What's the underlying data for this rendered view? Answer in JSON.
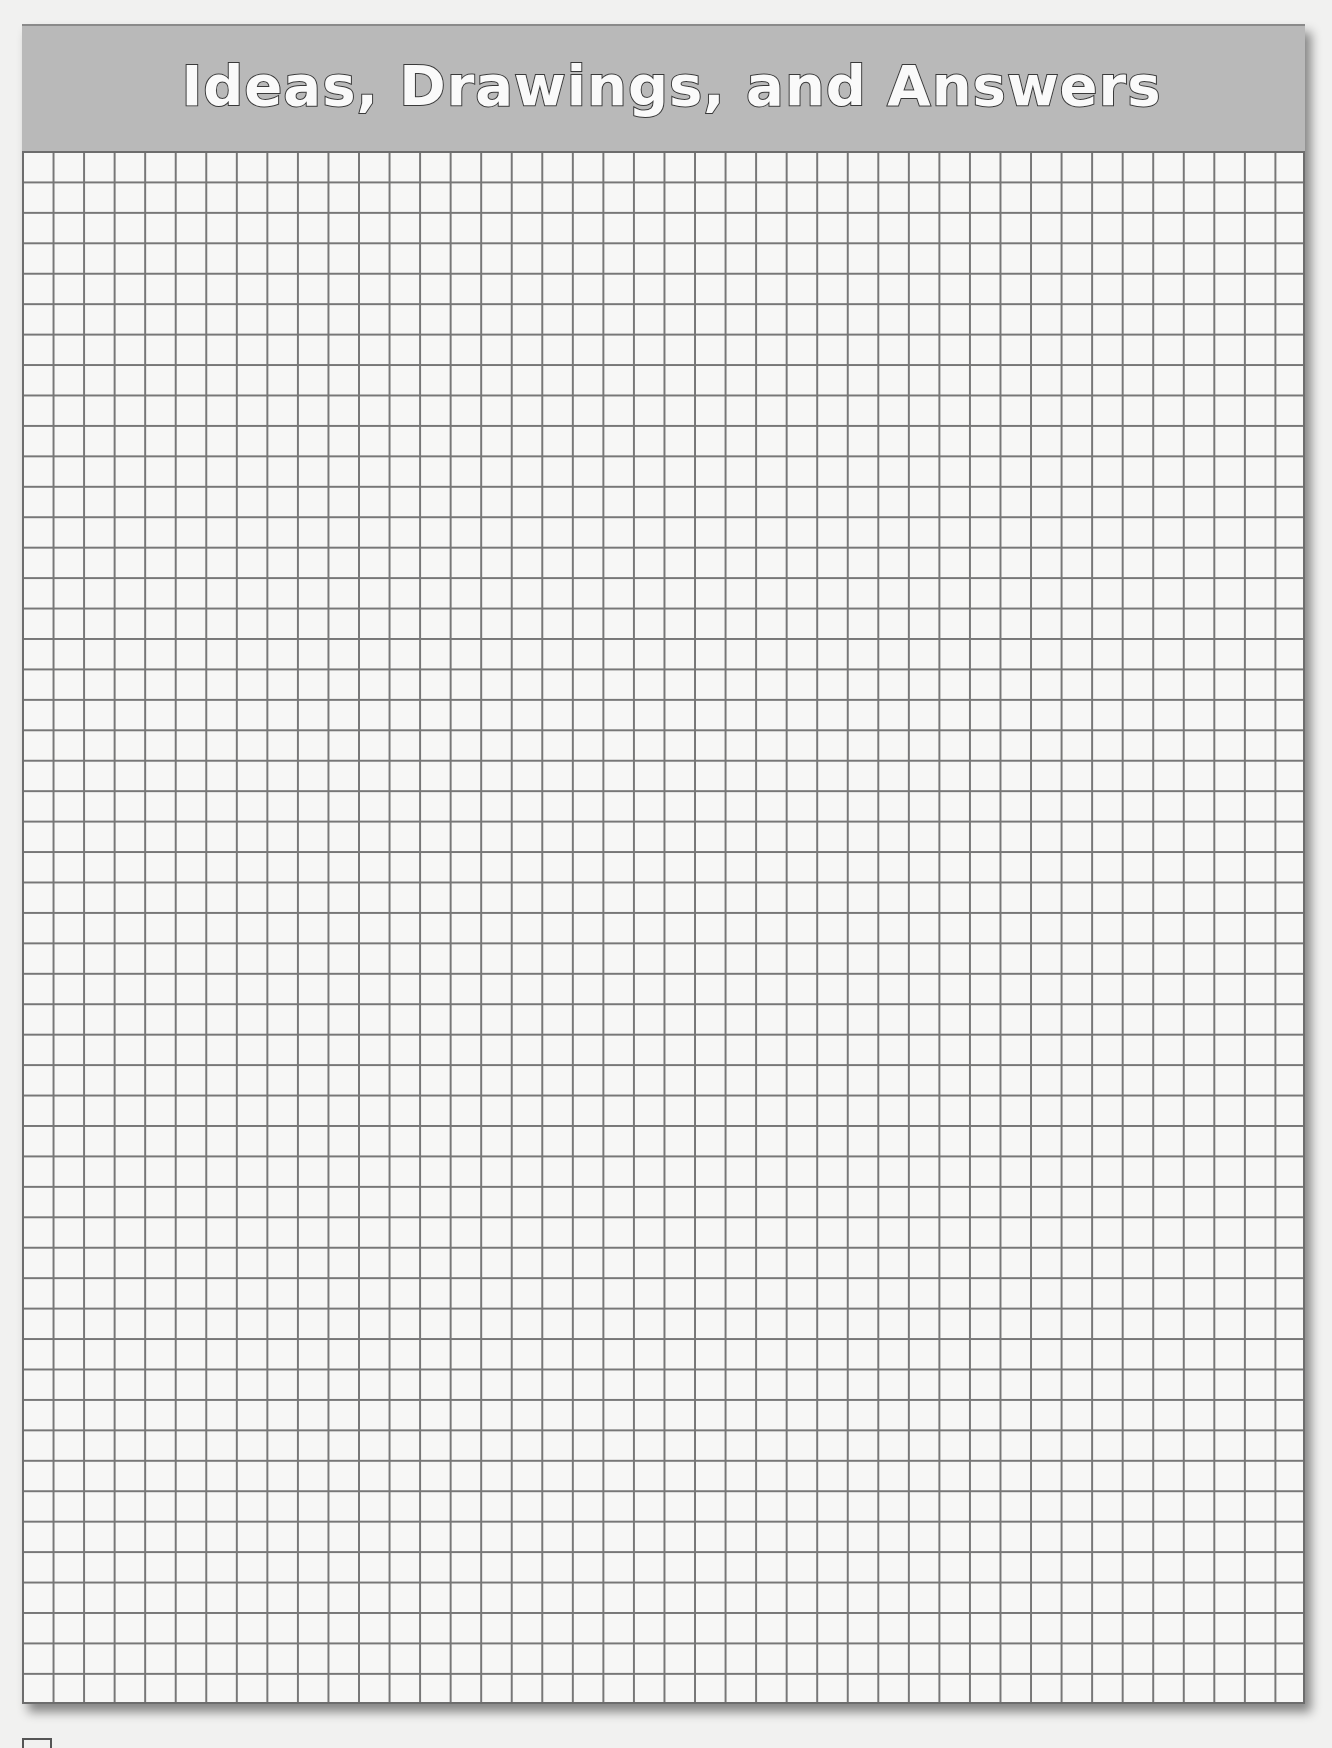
{
  "page": {
    "title": "Ideas, Drawings, and Answers",
    "section": "graph-paper worksheet",
    "grid": {
      "columns": 42,
      "rows": 51,
      "line_color": "#777777",
      "paper_color": "#f7f7f6"
    },
    "header": {
      "band_color": "#b9b9b9",
      "title_fill": "#fafafa",
      "title_outline": "#3a3a3a"
    }
  }
}
